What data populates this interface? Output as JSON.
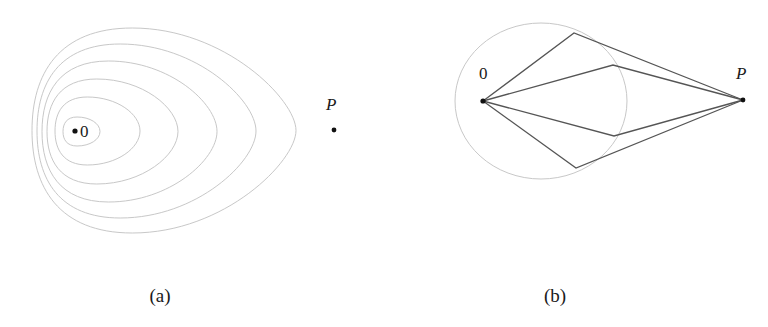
{
  "panel_a": {
    "caption": "(a)",
    "origin_label": "0",
    "target_label": "P",
    "origin": {
      "x": 75,
      "y": 131
    },
    "target": {
      "x": 334,
      "y": 130
    },
    "contour_color": "#c8c8c8",
    "contours": [
      {
        "left": 63,
        "right": 100,
        "top": 117,
        "bottom": 146
      },
      {
        "left": 55,
        "right": 140,
        "top": 97,
        "bottom": 165
      },
      {
        "left": 47,
        "right": 178,
        "top": 79,
        "bottom": 184
      },
      {
        "left": 42,
        "right": 217,
        "top": 61,
        "bottom": 202
      },
      {
        "left": 37,
        "right": 256,
        "top": 44,
        "bottom": 218
      },
      {
        "left": 32,
        "right": 296,
        "top": 28,
        "bottom": 233
      }
    ]
  },
  "panel_b": {
    "caption": "(b)",
    "origin_label": "0",
    "target_label": "P",
    "origin": {
      "x": 483,
      "y": 101
    },
    "target": {
      "x": 743,
      "y": 100
    },
    "circle": {
      "cx": 541,
      "cy": 101,
      "rx": 86,
      "ry": 78,
      "color": "#c8c8c8"
    },
    "path_color": "#555555",
    "paths": [
      {
        "vertex": {
          "x": 574,
          "y": 33
        }
      },
      {
        "vertex": {
          "x": 613,
          "y": 65
        }
      },
      {
        "vertex": {
          "x": 614,
          "y": 136
        }
      },
      {
        "vertex": {
          "x": 576,
          "y": 168
        }
      }
    ]
  }
}
